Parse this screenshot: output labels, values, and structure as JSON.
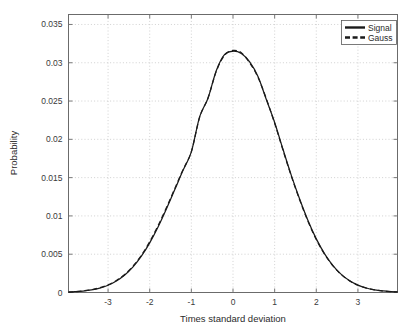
{
  "chart_data": {
    "type": "line",
    "title": "",
    "xlabel": "Times standard deviation",
    "ylabel": "Probability",
    "xlim": [
      -3.95,
      3.95
    ],
    "ylim": [
      0,
      0.0363
    ],
    "grid": true,
    "legend_position": "top-right",
    "xticks": [
      -3,
      -2,
      -1,
      0,
      1,
      2,
      3
    ],
    "xtick_labels": [
      "-3",
      "-2",
      "-1",
      "0",
      "1",
      "2",
      "3"
    ],
    "yticks": [
      0,
      0.005,
      0.01,
      0.015,
      0.02,
      0.025,
      0.03,
      0.035
    ],
    "ytick_labels": [
      "0",
      "0.005",
      "0.01",
      "0.015",
      "0.02",
      "0.025",
      "0.03",
      "0.035"
    ],
    "x": [
      -3.95,
      -3.8,
      -3.6,
      -3.4,
      -3.2,
      -3.0,
      -2.8,
      -2.6,
      -2.4,
      -2.2,
      -2.0,
      -1.8,
      -1.6,
      -1.4,
      -1.2,
      -1.0,
      -0.8,
      -0.6,
      -0.4,
      -0.2,
      0.0,
      0.2,
      0.4,
      0.6,
      0.8,
      1.0,
      1.2,
      1.4,
      1.6,
      1.8,
      2.0,
      2.2,
      2.4,
      2.6,
      2.8,
      3.0,
      3.2,
      3.4,
      3.6,
      3.8,
      3.95
    ],
    "series": [
      {
        "name": "Signal",
        "style": "solid",
        "color": "#1a1a1a",
        "values": [
          5e-05,
          0.0001,
          0.00019,
          0.00034,
          0.00058,
          0.00095,
          0.0015,
          0.00228,
          0.00335,
          0.00474,
          0.00648,
          0.00855,
          0.0109,
          0.01341,
          0.01595,
          0.01836,
          0.02297,
          0.02537,
          0.029,
          0.0311,
          0.0315,
          0.0312,
          0.0301,
          0.0282,
          0.0252,
          0.0222,
          0.0187,
          0.0153,
          0.0122,
          0.0094,
          0.007,
          0.00505,
          0.00352,
          0.00237,
          0.00154,
          0.00097,
          0.00059,
          0.00035,
          0.0002,
          0.00011,
          7e-05
        ]
      },
      {
        "name": "Gauss",
        "style": "dashed",
        "color": "#1a1a1a",
        "values": [
          6e-05,
          0.00011,
          0.00021,
          0.00037,
          0.00062,
          0.001,
          0.00156,
          0.00236,
          0.00345,
          0.00486,
          0.00663,
          0.00872,
          0.01106,
          0.01355,
          0.01604,
          0.0184,
          0.0229,
          0.0254,
          0.0289,
          0.031,
          0.0316,
          0.0313,
          0.03,
          0.0281,
          0.0253,
          0.0221,
          0.0186,
          0.0152,
          0.0121,
          0.0093,
          0.00692,
          0.005,
          0.00348,
          0.00234,
          0.00152,
          0.00095,
          0.00058,
          0.00034,
          0.00019,
          0.00011,
          7e-05
        ]
      }
    ]
  },
  "legend": {
    "entries": [
      {
        "label": "Signal",
        "style": "solid"
      },
      {
        "label": "Gauss",
        "style": "dashed"
      }
    ]
  }
}
